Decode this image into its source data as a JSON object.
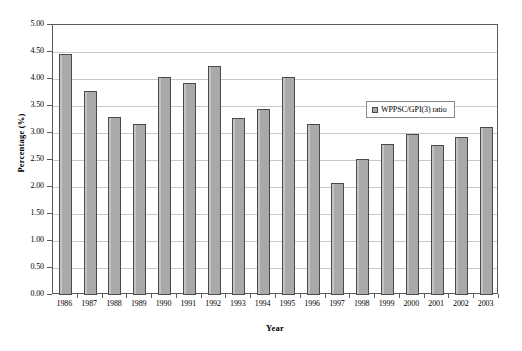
{
  "chart_data": {
    "type": "bar",
    "title": "",
    "xlabel": "Year",
    "ylabel": "Percentage (%)",
    "categories": [
      "1986",
      "1987",
      "1988",
      "1989",
      "1990",
      "1991",
      "1992",
      "1993",
      "1994",
      "1995",
      "1996",
      "1997",
      "1998",
      "1999",
      "2000",
      "2001",
      "2002",
      "2003"
    ],
    "values": [
      4.47,
      3.78,
      3.3,
      3.16,
      4.04,
      3.92,
      4.24,
      3.28,
      3.45,
      4.04,
      3.16,
      2.08,
      2.52,
      2.8,
      2.98,
      2.77,
      2.93,
      3.12
    ],
    "series": [
      {
        "name": "WPPSC/GPI(3) ratio",
        "values": [
          4.47,
          3.78,
          3.3,
          3.16,
          4.04,
          3.92,
          4.24,
          3.28,
          3.45,
          4.04,
          3.16,
          2.08,
          2.52,
          2.8,
          2.98,
          2.77,
          2.93,
          3.12
        ]
      }
    ],
    "ylim": [
      0.0,
      5.0
    ],
    "ytick_labels": [
      "0.00",
      "0.50",
      "1.00",
      "1.50",
      "2.00",
      "2.50",
      "3.00",
      "3.50",
      "4.00",
      "4.50",
      "5.00"
    ],
    "ytick_values": [
      0.0,
      0.5,
      1.0,
      1.5,
      2.0,
      2.5,
      3.0,
      3.5,
      4.0,
      4.5,
      5.0
    ],
    "grid": true,
    "grid_axis": "y",
    "legend": {
      "position": "inside-top-center",
      "entries": [
        {
          "label": "WPPSC/GPI(3) ratio",
          "color": "#a9a9a9"
        }
      ]
    },
    "colors": {
      "bar_fill": "#a9a9a9",
      "bar_edge": "#4a4a4a",
      "gridline": "#c9c9c9",
      "frame": "#5a5a5a",
      "background": "#ffffff"
    }
  }
}
